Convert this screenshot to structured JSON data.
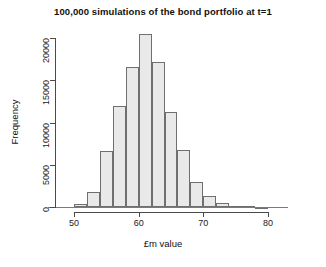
{
  "chart_data": {
    "type": "bar",
    "title": "100,000 simulations of the bond portfolio at t=1",
    "xlabel": "£m value",
    "ylabel": "Frequency",
    "xlim": [
      48,
      82
    ],
    "ylim": [
      0,
      21500
    ],
    "grid": false,
    "legend": null,
    "bin_width": 2,
    "bin_starts": [
      50,
      52,
      54,
      56,
      58,
      60,
      62,
      64,
      66,
      68,
      70,
      72,
      74,
      76,
      78
    ],
    "categories": [
      "50-52",
      "52-54",
      "54-56",
      "56-58",
      "58-60",
      "60-62",
      "62-64",
      "64-66",
      "66-68",
      "68-70",
      "70-72",
      "72-74",
      "74-76",
      "76-78",
      "78-80"
    ],
    "values": [
      300,
      1800,
      6600,
      12000,
      16600,
      20500,
      17200,
      11300,
      6700,
      3000,
      1300,
      500,
      150,
      60,
      20
    ],
    "xticks": [
      50,
      60,
      70,
      80
    ],
    "xtick_labels": [
      "50",
      "60",
      "70",
      "80"
    ],
    "yticks": [
      0,
      5000,
      10000,
      15000,
      20000
    ],
    "ytick_labels": [
      "0",
      "5000",
      "10000",
      "15000",
      "20000"
    ],
    "bar_fill_color": "#e9e9e9",
    "bar_border_color": "#6f6f6f",
    "axis_color": "#4a4a4a",
    "text_color": "#111111"
  }
}
